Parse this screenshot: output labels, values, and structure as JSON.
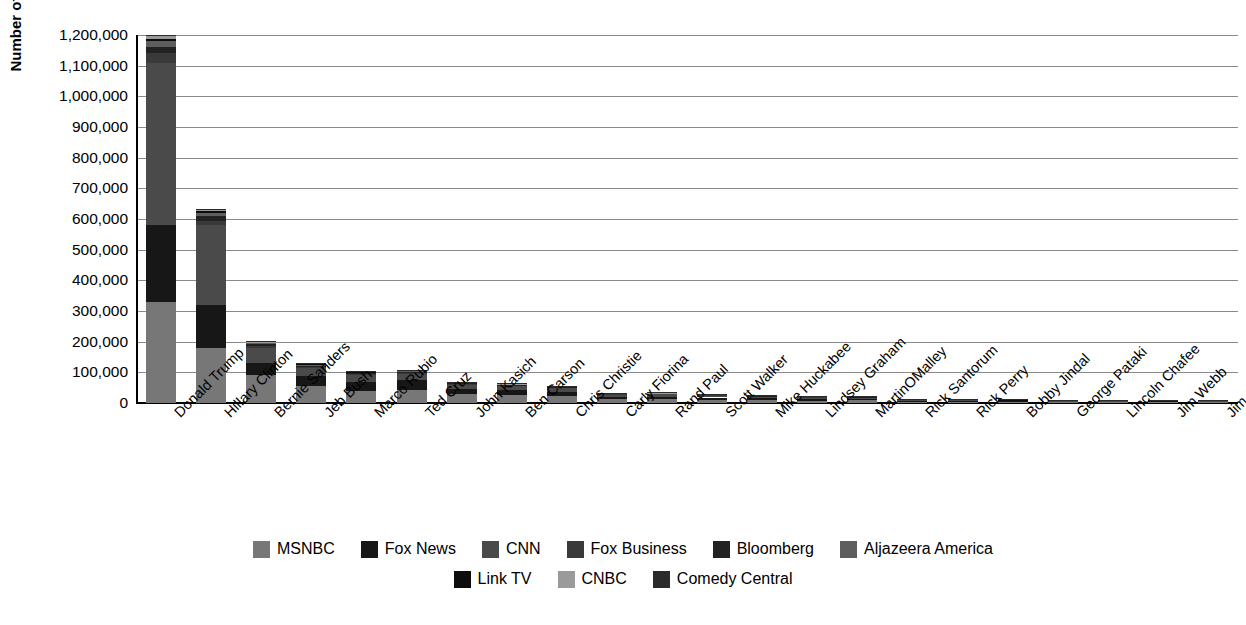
{
  "chart_data": {
    "type": "bar",
    "stacked": true,
    "title": "",
    "xlabel": "",
    "ylabel": "Number of Mentions",
    "ylim": [
      0,
      1200000
    ],
    "ytick_step": 100000,
    "ytick_labels": [
      "1,200,000",
      "1,100,000",
      "1,000,000",
      "900,000",
      "800,000",
      "700,000",
      "600,000",
      "500,000",
      "400,000",
      "300,000",
      "200,000",
      "100,000",
      "0"
    ],
    "grid": true,
    "legend_position": "bottom",
    "categories": [
      "Donald Trump",
      "Hillary Clinton",
      "Bernie Sanders",
      "Jeb Bush",
      "Marco Rubio",
      "Ted Cruz",
      "John Kasich",
      "Ben Carson",
      "Chris Christie",
      "Carly Fiorina",
      "Rand Paul",
      "Scott Walker",
      "Mike Huckabee",
      "Lindsey Graham",
      "MartinOMalley",
      "Rick Santorum",
      "Rick Perry",
      "Bobby Jindal",
      "George Pataki",
      "Lincoln Chafee",
      "Jim Webb",
      "Jim Gilmore"
    ],
    "series": [
      {
        "name": "MSNBC",
        "color": "#777777",
        "values": [
          330000,
          180000,
          90000,
          55000,
          40000,
          42000,
          28000,
          25000,
          22000,
          12000,
          12000,
          11000,
          9000,
          8000,
          9000,
          4000,
          4000,
          3500,
          3000,
          3000,
          3500,
          3000
        ]
      },
      {
        "name": "Fox News",
        "color": "#171717",
        "values": [
          250000,
          140000,
          42000,
          32000,
          30000,
          33000,
          17000,
          16000,
          14000,
          8000,
          9000,
          7000,
          6000,
          5000,
          4000,
          2500,
          2500,
          2000,
          1800,
          1500,
          1800,
          1500
        ]
      },
      {
        "name": "CNN",
        "color": "#4a4a4a",
        "values": [
          530000,
          260000,
          48000,
          28000,
          22000,
          21000,
          15000,
          14000,
          12000,
          7000,
          7000,
          6000,
          5000,
          4500,
          4000,
          2000,
          2000,
          1800,
          1500,
          1400,
          1500,
          1300
        ]
      },
      {
        "name": "Fox Business",
        "color": "#3a3a3a",
        "values": [
          30000,
          12000,
          6000,
          4000,
          3000,
          3000,
          2000,
          2000,
          1500,
          1000,
          1000,
          900,
          800,
          700,
          600,
          400,
          400,
          350,
          300,
          300,
          300,
          250
        ]
      },
      {
        "name": "Bloomberg",
        "color": "#222222",
        "values": [
          22000,
          18000,
          5000,
          3000,
          2500,
          2500,
          1800,
          1500,
          1200,
          800,
          800,
          700,
          600,
          600,
          500,
          300,
          300,
          300,
          250,
          250,
          250,
          200
        ]
      },
      {
        "name": "Aljazeera America",
        "color": "#5e5e5e",
        "values": [
          18000,
          10000,
          4000,
          2500,
          2000,
          2000,
          1200,
          1200,
          1000,
          600,
          600,
          500,
          500,
          400,
          400,
          250,
          250,
          200,
          200,
          200,
          200,
          150
        ]
      },
      {
        "name": "Link TV",
        "color": "#0d0d0d",
        "values": [
          8000,
          5000,
          2000,
          1200,
          1000,
          1000,
          700,
          600,
          500,
          300,
          300,
          300,
          250,
          200,
          200,
          150,
          150,
          120,
          100,
          100,
          100,
          100
        ]
      },
      {
        "name": "CNBC",
        "color": "#9a9a9a",
        "values": [
          9000,
          5000,
          2500,
          1500,
          1200,
          1200,
          800,
          700,
          600,
          400,
          400,
          350,
          300,
          250,
          250,
          150,
          150,
          150,
          120,
          120,
          120,
          100
        ]
      },
      {
        "name": "Comedy Central",
        "color": "#2b2b2b",
        "values": [
          3000,
          1500,
          800,
          500,
          400,
          400,
          300,
          250,
          200,
          150,
          150,
          120,
          100,
          100,
          100,
          80,
          80,
          60,
          60,
          60,
          60,
          50
        ]
      }
    ],
    "totals": [
      1200000,
      631500,
      200300,
      127700,
      102100,
      105100,
      66800,
      61250,
      53000,
      30250,
      31250,
      26870,
      22550,
      19750,
      19050,
      9830,
      9830,
      7980,
      7330,
      6930,
      7830,
      6650
    ]
  },
  "legend": {
    "rows": [
      [
        "MSNBC",
        "Fox News",
        "CNN",
        "Fox Business",
        "Bloomberg",
        "Aljazeera America"
      ],
      [
        "Link TV",
        "CNBC",
        "Comedy Central"
      ]
    ]
  }
}
